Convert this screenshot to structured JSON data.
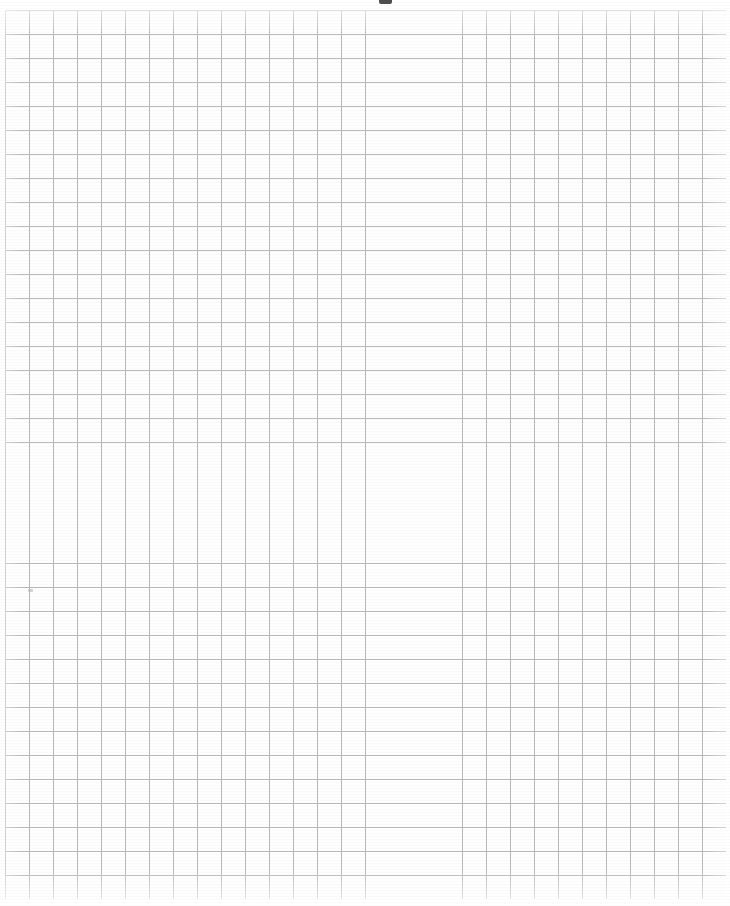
{
  "page": {
    "kind": "scanned-graph-paper",
    "width_px": 730,
    "height_px": 906,
    "background_color": "#fefefe",
    "caption": "Blank sheet of scanned quadrille graph paper"
  },
  "grid": {
    "label": "graph-paper-grid",
    "columns": 30,
    "rows": 37,
    "cell_width_px": 24,
    "cell_height_px": 24,
    "line_color": "#b9b9b9",
    "line_width_px": 1,
    "origin_x_px": 5,
    "origin_y_px": 10,
    "grid_width_px": 721,
    "grid_height_px": 889,
    "has_major_gridlines": false,
    "content": ""
  },
  "margins": {
    "top_label": "top-margin",
    "left_label": "left-margin",
    "right_label": "right-margin",
    "bottom_label": "bottom-margin",
    "top_px": 10,
    "left_px": 5,
    "right_px": 4,
    "bottom_px": 7
  },
  "artifacts": {
    "top_edge_mark": {
      "name": "top-edge-scan-artifact",
      "x_px": 379,
      "y_px": 0,
      "width_px": 13,
      "height_px": 4,
      "color": "#3b3b3b"
    },
    "stray_speck": {
      "name": "stray-pencil-speck",
      "x_px": 28,
      "y_px": 589,
      "width_px": 5,
      "height_px": 3,
      "color": "#b0b0b0"
    }
  }
}
